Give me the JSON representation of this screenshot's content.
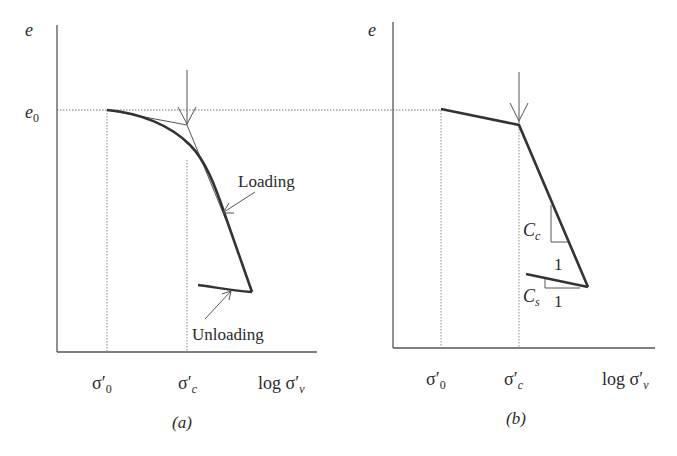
{
  "figure": {
    "panels": [
      {
        "id": "a",
        "caption": "(a)",
        "y_axis_label": "e",
        "e0_label": "e",
        "e0_subscript": "0",
        "x_ticks": [
          {
            "base": "σ′",
            "sub": "0"
          },
          {
            "base": "σ′",
            "sub": "c"
          }
        ],
        "x_axis_label": "log σ′",
        "x_axis_label_sub": "v",
        "annotations": {
          "loading": "Loading",
          "unloading": "Unloading"
        }
      },
      {
        "id": "b",
        "caption": "(b)",
        "y_axis_label": "e",
        "x_ticks": [
          {
            "base": "σ′",
            "sub": "0"
          },
          {
            "base": "σ′",
            "sub": "c"
          }
        ],
        "x_axis_label": "log σ′",
        "x_axis_label_sub": "v",
        "annotations": {
          "cc": "C",
          "cc_sub": "c",
          "cs": "C",
          "cs_sub": "s",
          "cc_run": "1",
          "cs_run": "1"
        }
      }
    ],
    "colors": {
      "curve": "#333333",
      "axis": "#555555",
      "dotted": "#777777"
    }
  }
}
